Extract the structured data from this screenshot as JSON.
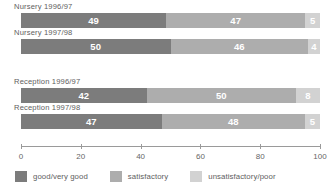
{
  "chart_data": {
    "type": "bar",
    "orientation": "horizontal",
    "stacked": true,
    "title": "",
    "xlabel": "",
    "ylabel": "",
    "xlim": [
      0,
      100
    ],
    "grid": false,
    "legend_position": "bottom",
    "tick_labels": [
      "0",
      "20",
      "40",
      "60",
      "80",
      "100"
    ],
    "ticks": [
      0,
      20,
      40,
      60,
      80,
      100
    ],
    "categories": [
      "Nursery 1996/97",
      "Nursery 1997/98",
      "Reception 1996/97",
      "Reception 1997/98"
    ],
    "series": [
      {
        "name": "good/very good",
        "color": "#7c7c7c",
        "values": [
          49,
          50,
          42,
          47
        ]
      },
      {
        "name": "satisfactory",
        "color": "#adadad",
        "values": [
          47,
          46,
          50,
          48
        ]
      },
      {
        "name": "unsatisfactory/poor",
        "color": "#d2d2d2",
        "values": [
          5,
          4,
          8,
          5
        ]
      }
    ],
    "groups": [
      {
        "bars": [
          {
            "label": "Nursery 1996/97",
            "segments": [
              {
                "series": "good/very good",
                "value": 49,
                "value_text": "49"
              },
              {
                "series": "satisfactory",
                "value": 47,
                "value_text": "47"
              },
              {
                "series": "unsatisfactory/poor",
                "value": 5,
                "value_text": "5"
              }
            ]
          },
          {
            "label": "Nursery 1997/98",
            "segments": [
              {
                "series": "good/very good",
                "value": 50,
                "value_text": "50"
              },
              {
                "series": "satisfactory",
                "value": 46,
                "value_text": "46"
              },
              {
                "series": "unsatisfactory/poor",
                "value": 4,
                "value_text": "4"
              }
            ]
          }
        ]
      },
      {
        "bars": [
          {
            "label": "Reception 1996/97",
            "segments": [
              {
                "series": "good/very good",
                "value": 42,
                "value_text": "42"
              },
              {
                "series": "satisfactory",
                "value": 50,
                "value_text": "50"
              },
              {
                "series": "unsatisfactory/poor",
                "value": 8,
                "value_text": "8"
              }
            ]
          },
          {
            "label": "Reception 1997/98",
            "segments": [
              {
                "series": "good/very good",
                "value": 47,
                "value_text": "47"
              },
              {
                "series": "satisfactory",
                "value": 48,
                "value_text": "48"
              },
              {
                "series": "unsatisfactory/poor",
                "value": 5,
                "value_text": "5"
              }
            ]
          }
        ]
      }
    ]
  },
  "legend": {
    "items": [
      {
        "label": "good/very good",
        "color": "#7c7c7c"
      },
      {
        "label": "satisfactory",
        "color": "#adadad"
      },
      {
        "label": "unsatisfactory/poor",
        "color": "#d2d2d2"
      }
    ]
  }
}
